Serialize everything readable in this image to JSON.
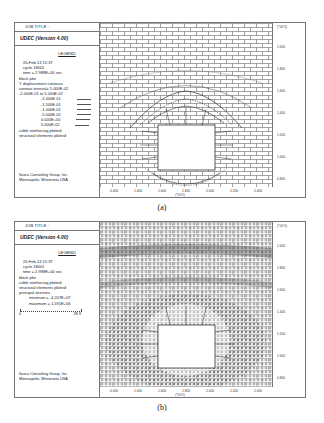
{
  "panels": [
    {
      "id": "a",
      "job_title": "JOB TITLE :",
      "app_title": "UDEC (Version 4.00)",
      "legend_heading": "LEGEND",
      "info_lines": [
        "20-Feb-13  15:37",
        "cycle    18001",
        "time  =  2.988E+00 sec",
        "block plot",
        "Y displacement contours",
        "contour interval= 5.000E-02",
        "-2.000E-01 to  5.000E-02"
      ],
      "contour_levels": [
        "-2.000E-01",
        "-1.500E-01",
        "-1.000E-01",
        "-5.000E-02",
        "0.000E+00",
        "5.000E-02"
      ],
      "trailing_lines": [
        "cable reinforcing plotted",
        "structural elements plotted"
      ],
      "footer": [
        "Itasca Consulting Group, Inc.",
        "Minneapolis, Minnesota  USA"
      ],
      "y_ticks": [
        "2.200",
        "2.000",
        "1.800",
        "1.600",
        "1.400",
        "1.200",
        "1.000",
        "0.800"
      ],
      "y_unit": "(*10^1)",
      "x_ticks": [
        "0.400",
        "1.400",
        "1.600",
        "1.800",
        "2.000",
        "2.200",
        "2.400"
      ],
      "x_unit": "(*10^1)",
      "caption": "(a)"
    },
    {
      "id": "b",
      "job_title": "JOB TITLE :",
      "app_title": "UDEC (Version 4.00)",
      "legend_heading": "LEGEND",
      "info_lines": [
        "20-Feb-13  15:37",
        "cycle    18001",
        "time  =  2.988E+00 sec",
        "block plot",
        "cable reinforcing plotted",
        "structural elements plotted",
        "principal stresses"
      ],
      "stress_lines": [
        "minimum = -4.207E+07",
        "maximum =  1.591E+06"
      ],
      "scale": {
        "min": "0",
        "max": "2E 8"
      },
      "footer": [
        "Itasca Consulting Group, Inc.",
        "Minneapolis, Minnesota  USA"
      ],
      "y_ticks": [
        "2.200",
        "2.000",
        "1.800",
        "1.600",
        "1.400",
        "1.200",
        "1.000",
        "0.800"
      ],
      "y_unit": "(*10^1)",
      "x_ticks": [
        "0.400",
        "1.400",
        "1.600",
        "1.800",
        "2.000",
        "2.200",
        "2.400"
      ],
      "x_unit": "(*10^1)",
      "caption": "(b)"
    }
  ]
}
